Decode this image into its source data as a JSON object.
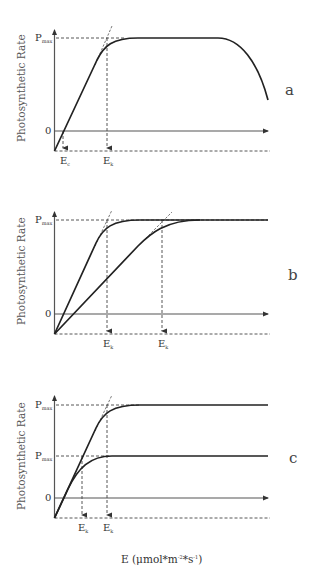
{
  "figure": {
    "y_axis_label": "Photosynthetic Rate",
    "x_axis_label": "E (μmol*m⁻²*s⁻¹)",
    "x_axis_label_main": "E (μmol*m",
    "x_axis_label_exp1": "-2",
    "x_axis_label_mid": "*s",
    "x_axis_label_exp2": "-1",
    "x_axis_label_end": ")",
    "colors": {
      "curve": "#222222",
      "axis": "#555555",
      "dashed": "#444444",
      "background": "#ffffff"
    }
  },
  "panels": [
    {
      "id": "a",
      "label": "a",
      "y_ticks": [
        {
          "main": "P",
          "sub": "max"
        },
        {
          "main": "0",
          "sub": ""
        }
      ],
      "x_marks": [
        {
          "main": "E",
          "sub": "c"
        },
        {
          "main": "E",
          "sub": "k"
        }
      ],
      "description": "Single P-E curve: linear rise crossing zero at Ec, saturation at Ek, plateau at Pmax, then photoinhibition decline"
    },
    {
      "id": "b",
      "label": "b",
      "y_ticks": [
        {
          "main": "P",
          "sub": "max"
        },
        {
          "main": "0",
          "sub": ""
        }
      ],
      "x_marks": [
        {
          "main": "E",
          "sub": "k"
        },
        {
          "main": "E",
          "sub": "k"
        }
      ],
      "description": "Two curves with same Pmax but different initial slopes, giving two Ek values"
    },
    {
      "id": "c",
      "label": "c",
      "y_ticks": [
        {
          "main": "P",
          "sub": "max"
        },
        {
          "main": "P",
          "sub": "max"
        },
        {
          "main": "0",
          "sub": ""
        }
      ],
      "x_marks": [
        {
          "main": "E",
          "sub": "k"
        },
        {
          "main": "E",
          "sub": "k"
        }
      ],
      "description": "Two curves with same initial slope but different Pmax, giving two Ek values"
    }
  ]
}
